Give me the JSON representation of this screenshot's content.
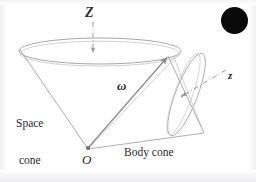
{
  "figure": {
    "background_color": "#ffffff",
    "line_color": "#9a9a9a",
    "vector_color": "#7a7a7a",
    "text_color": "#2b2b2b",
    "blob_color": "#090909"
  },
  "labels": {
    "fixed_axis": "Z",
    "body_axis": "z",
    "angular_velocity": "ω",
    "origin": "O",
    "space_cone_line1": "Space",
    "space_cone_line2": "cone",
    "body_cone": "Body cone"
  },
  "icons": {
    "blob": "filled-circle-marker"
  },
  "geometry": {
    "origin_point": [
      88,
      149
    ],
    "space_cone_rim_center": [
      100,
      51
    ],
    "space_cone_rim_rx": 81,
    "space_cone_rim_ry": 13,
    "contact_point": [
      168,
      56
    ],
    "body_cone_bottom_vertex": [
      204,
      133
    ],
    "Z_axis_line": [
      [
        93,
        22
      ],
      [
        93,
        53
      ]
    ],
    "z_axis_line": [
      [
        183,
        95
      ],
      [
        224,
        71
      ]
    ],
    "omega_vector": [
      [
        88,
        148
      ],
      [
        168,
        57
      ]
    ]
  }
}
